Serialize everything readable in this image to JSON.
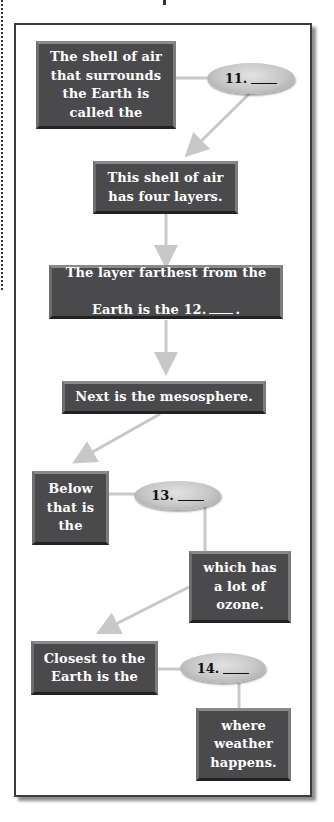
{
  "diagram": {
    "colors": {
      "box_fill": "#4a4a4d",
      "box_text": "#ffffff",
      "oval_fill": "#c6c6c6",
      "connector": "#c8c8c8",
      "frame_border": "#3c3c3c"
    },
    "boxes": [
      {
        "id": "b1",
        "text": "The shell of air\nthat surrounds\nthe Earth is\ncalled the"
      },
      {
        "id": "b2",
        "text": "This shell of air\nhas four layers."
      },
      {
        "id": "b3",
        "line1": "The layer farthest from the",
        "line2_prefix": "Earth is the 12.",
        "line2_suffix": "."
      },
      {
        "id": "b4",
        "text": "Next is the mesosphere."
      },
      {
        "id": "b5",
        "text": "Below\nthat is\nthe"
      },
      {
        "id": "b6",
        "text": "which has\na lot of\nozone."
      },
      {
        "id": "b7",
        "text": "Closest to the\nEarth is the"
      },
      {
        "id": "b8",
        "text": "where\nweather\nhappens."
      }
    ],
    "blanks": [
      {
        "id": "o11",
        "number": "11.",
        "blank": ""
      },
      {
        "id": "o13",
        "number": "13.",
        "blank": ""
      },
      {
        "id": "o14",
        "number": "14.",
        "blank": ""
      }
    ]
  }
}
